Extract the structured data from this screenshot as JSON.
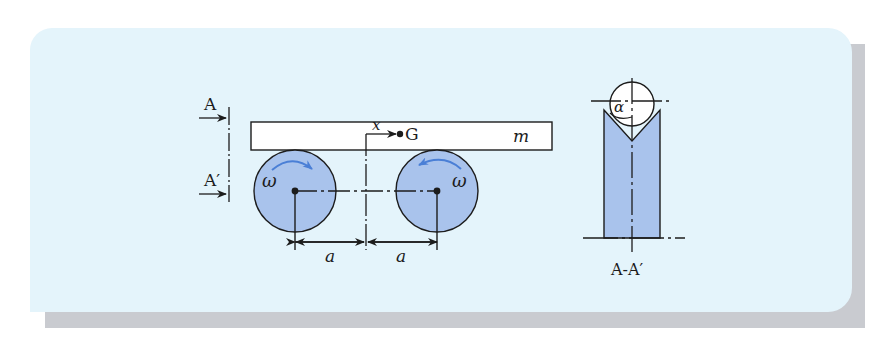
{
  "figure": {
    "panel_background": "#e4f4fb",
    "shadow_color": "#c9cbd0",
    "wheel_fill": "#a9c3ec",
    "rotation_arrow_color": "#4a7fd6",
    "line_color": "#1c1c1c"
  },
  "labels": {
    "section_top": "A",
    "section_bottom": "A′",
    "offset": "x",
    "center_of_gravity": "G",
    "mass": "m",
    "omega_left": "ω",
    "omega_right": "ω",
    "distance_left": "a",
    "distance_right": "a",
    "angle": "α",
    "section_caption": "A-A′"
  },
  "components": {
    "bar": "rigid bar of mass m resting on two wheels",
    "left_wheel": "rotates clockwise at ω",
    "right_wheel": "rotates counter-clockwise at ω",
    "section_view": "cross-section A-A′ showing bar in V-groove with half-angle α"
  }
}
